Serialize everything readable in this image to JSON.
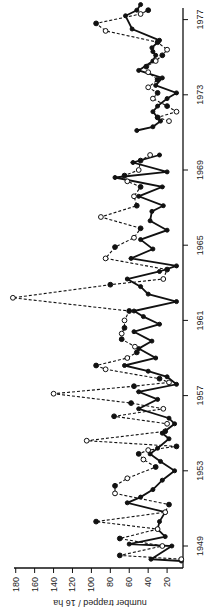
{
  "chart_data": {
    "type": "line",
    "orientation": "rotated-90",
    "title": "",
    "xlabel": "",
    "ylabel": "number trapped / 16 ha",
    "ylim": [
      0,
      180
    ],
    "yticks": [
      20,
      40,
      60,
      80,
      100,
      120,
      140,
      160,
      180
    ],
    "xticks": [
      1949,
      1953,
      1957,
      1961,
      1965,
      1969,
      1973,
      1977
    ],
    "xlim": [
      1948.2,
      1978
    ],
    "grid": false,
    "legend": null,
    "series": [
      {
        "name": "solid",
        "style": "solid",
        "points": [
          [
            1948.2,
            5
          ],
          [
            1948.3,
            37
          ],
          [
            1949.0,
            15
          ],
          [
            1949.1,
            60
          ],
          [
            1949.5,
            22
          ],
          [
            1949.9,
            30
          ],
          [
            1950.3,
            28
          ],
          [
            1950.8,
            22
          ],
          [
            1951.3,
            62
          ],
          [
            1951.6,
            48
          ],
          [
            1952.0,
            35
          ],
          [
            1952.5,
            25
          ],
          [
            1953.0,
            12
          ],
          [
            1953.5,
            27
          ],
          [
            1953.9,
            38
          ],
          [
            1954.2,
            30
          ],
          [
            1954.7,
            18
          ],
          [
            1955.0,
            25
          ],
          [
            1955.5,
            12
          ],
          [
            1955.8,
            18
          ],
          [
            1956.3,
            50
          ],
          [
            1956.8,
            30
          ],
          [
            1957.2,
            50
          ],
          [
            1957.6,
            10
          ],
          [
            1958.0,
            20
          ],
          [
            1958.3,
            40
          ],
          [
            1958.6,
            65
          ],
          [
            1959.0,
            32
          ],
          [
            1959.5,
            50
          ],
          [
            1959.9,
            36
          ],
          [
            1960.4,
            55
          ],
          [
            1960.8,
            28
          ],
          [
            1961.2,
            45
          ],
          [
            1961.5,
            55
          ],
          [
            1962.0,
            10
          ],
          [
            1962.4,
            40
          ],
          [
            1962.8,
            48
          ],
          [
            1963.2,
            62
          ],
          [
            1963.6,
            28
          ],
          [
            1963.9,
            10
          ],
          [
            1964.3,
            58
          ],
          [
            1964.8,
            35
          ],
          [
            1965.3,
            48
          ],
          [
            1965.8,
            20
          ],
          [
            1966.3,
            38
          ],
          [
            1966.8,
            36
          ],
          [
            1967.1,
            24
          ],
          [
            1967.6,
            50
          ],
          [
            1968.1,
            25
          ],
          [
            1968.6,
            75
          ],
          [
            1968.9,
            20
          ],
          [
            1969.4,
            56
          ],
          [
            1969.8,
            28
          ],
          null,
          [
            1971.1,
            52
          ],
          [
            1971.3,
            35
          ],
          [
            1971.6,
            27
          ],
          [
            1971.8,
            30
          ],
          [
            1972.1,
            35
          ],
          [
            1972.4,
            30
          ],
          [
            1972.8,
            20
          ],
          [
            1973.1,
            10
          ],
          [
            1973.5,
            32
          ],
          [
            1973.9,
            25
          ],
          [
            1974.3,
            50
          ],
          [
            1974.8,
            35
          ],
          [
            1975.1,
            32
          ],
          [
            1975.3,
            35
          ],
          [
            1975.5,
            36
          ],
          [
            1975.9,
            28
          ],
          [
            1976.5,
            57
          ],
          [
            1977.2,
            64
          ],
          [
            1977.5,
            52
          ],
          [
            1977.8,
            48
          ]
        ]
      },
      {
        "name": "dashed",
        "style": "dashed",
        "points": [
          [
            1948.3,
            5
          ],
          [
            1948.5,
            70
          ],
          [
            1949.0,
            25
          ],
          [
            1949.4,
            70
          ],
          [
            1949.9,
            30
          ],
          [
            1950.3,
            95
          ],
          [
            1950.8,
            22
          ],
          [
            1951.2,
            18
          ],
          [
            1951.8,
            75
          ],
          [
            1952.2,
            75
          ],
          [
            1952.6,
            62
          ],
          [
            1953.2,
            32
          ],
          [
            1953.6,
            45
          ],
          [
            1953.9,
            50
          ],
          [
            1954.1,
            40
          ],
          [
            1954.3,
            10
          ],
          [
            1954.6,
            105
          ],
          [
            1955.1,
            22
          ],
          [
            1955.5,
            20
          ],
          [
            1955.9,
            76
          ],
          [
            1956.3,
            24
          ],
          [
            1956.6,
            58
          ],
          [
            1957.1,
            140
          ],
          [
            1957.5,
            55
          ],
          [
            1957.7,
            18
          ],
          [
            1957.9,
            28
          ],
          [
            1958.4,
            85
          ],
          [
            1958.6,
            95
          ],
          [
            1959.0,
            62
          ],
          [
            1959.3,
            52
          ],
          [
            1959.6,
            54
          ],
          [
            1960.0,
            68
          ],
          [
            1960.3,
            68
          ],
          [
            1960.6,
            65
          ],
          [
            1961.0,
            65
          ],
          [
            1961.5,
            60
          ],
          [
            1962.2,
            183
          ],
          [
            1962.9,
            80
          ],
          [
            1963.2,
            24
          ],
          [
            1963.7,
            20
          ],
          [
            1964.3,
            85
          ],
          [
            1964.9,
            75
          ],
          [
            1965.4,
            55
          ],
          [
            1965.9,
            48
          ],
          [
            1966.5,
            90
          ],
          [
            1967.1,
            52
          ],
          [
            1967.6,
            55
          ],
          [
            1968.1,
            48
          ],
          [
            1968.4,
            62
          ],
          [
            1968.7,
            65
          ],
          [
            1969.0,
            50
          ],
          [
            1969.5,
            48
          ],
          [
            1969.8,
            38
          ],
          null,
          [
            1971.6,
            18
          ],
          [
            1971.8,
            30
          ],
          [
            1972.1,
            10
          ],
          [
            1972.4,
            20
          ],
          [
            1972.8,
            35
          ],
          [
            1973.1,
            30
          ],
          [
            1973.4,
            40
          ],
          [
            1973.8,
            30
          ],
          [
            1974.2,
            40
          ],
          [
            1974.5,
            42
          ],
          [
            1974.8,
            32
          ],
          [
            1975.1,
            25
          ],
          [
            1975.4,
            20
          ],
          [
            1975.8,
            30
          ],
          [
            1976.4,
            85
          ],
          [
            1976.8,
            95
          ],
          [
            1977.3,
            48
          ],
          [
            1977.5,
            40
          ]
        ]
      }
    ]
  },
  "axis": {
    "ylabel": "number trapped / 16 ha",
    "ytick_labels": [
      "180",
      "160",
      "140",
      "120",
      "100",
      "80",
      "60",
      "40",
      "20"
    ],
    "xtick_labels": [
      "1949",
      "1953",
      "1957",
      "1961",
      "1965",
      "1969",
      "1973",
      "1977"
    ]
  }
}
